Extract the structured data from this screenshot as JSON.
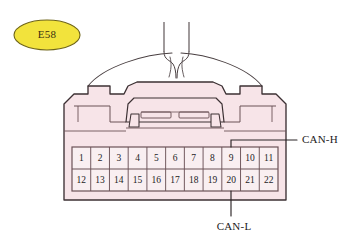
{
  "figure": {
    "kind": "automotive-connector-pinout-diagram",
    "background_color": "#ffffff"
  },
  "badge": {
    "label": "E58",
    "fill_color": "#f2e33c",
    "stroke_color": "#6e6418",
    "text_color": "#3a2f10",
    "cx": 47,
    "cy": 35,
    "rx": 33,
    "ry": 15
  },
  "connector": {
    "body_fill": "#f7e4e8",
    "body_stroke": "#3c3033",
    "latch_fill": "#f7e4e8",
    "shadow_fill": "#e8d2d8",
    "left": 64,
    "right": 286,
    "top": 86,
    "bottom": 200
  },
  "harness": {
    "stroke_color": "#4a4042",
    "wire_count": 2,
    "description": "wire bundle entering from top center"
  },
  "pin_grid": {
    "stroke_color": "#6b5257",
    "cell_fill": "#f9eff1",
    "text_color": "#241c1e",
    "left": 72,
    "right": 278,
    "top": 147,
    "middle": 169,
    "bottom": 191,
    "columns": 11,
    "rows": [
      {
        "name": "upper-row",
        "pins": [
          "1",
          "2",
          "3",
          "4",
          "5",
          "6",
          "7",
          "8",
          "9",
          "10",
          "11"
        ]
      },
      {
        "name": "lower-row",
        "pins": [
          "12",
          "13",
          "14",
          "15",
          "16",
          "17",
          "18",
          "19",
          "20",
          "21",
          "22"
        ]
      }
    ]
  },
  "callouts": [
    {
      "id": "can-h",
      "label": "CAN-H",
      "pin": "9",
      "text_x": 302,
      "text_y": 140,
      "leader_color": "#2b2426",
      "leader": "from pin 9 top edge up to y=140 then right to label"
    },
    {
      "id": "can-l",
      "label": "CAN-L",
      "pin": "20",
      "text_x": 234,
      "text_y": 227,
      "leader_color": "#2b2426",
      "leader": "from pin 20 bottom edge straight down to label"
    }
  ]
}
